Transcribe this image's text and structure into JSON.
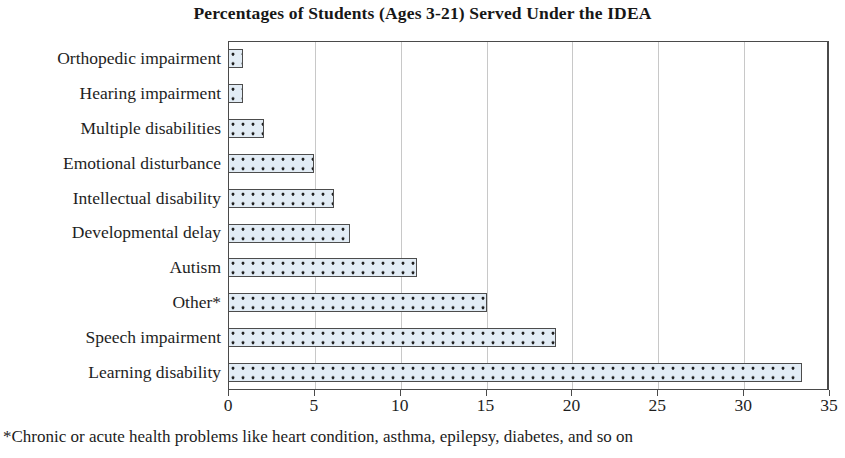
{
  "chart_data": {
    "type": "bar",
    "orientation": "horizontal",
    "title": "Percentages of Students (Ages 3-21) Served Under the IDEA",
    "xlabel": "",
    "ylabel": "",
    "xlim": [
      0,
      35
    ],
    "xticks": [
      0,
      5,
      10,
      15,
      20,
      25,
      30,
      35
    ],
    "xtick_labels": [
      "0",
      "5",
      "10",
      "15",
      "20",
      "25",
      "30",
      "35"
    ],
    "grid": "vertical",
    "legend": "none",
    "categories": [
      "Orthopedic impairment",
      "Hearing impairment",
      "Multiple disabilities",
      "Emotional disturbance",
      "Intellectual disability",
      "Developmental delay",
      "Autism",
      "Other*",
      "Speech impairment",
      "Learning disability"
    ],
    "values": [
      0.9,
      0.9,
      2.1,
      5.0,
      6.2,
      7.1,
      11.0,
      15.1,
      19.1,
      33.4
    ],
    "bar_fill_color": "#e2ecf5",
    "bar_edge_color": "#4c4c4c",
    "bar_pattern": "dotted",
    "footnote": "*Chronic or acute health problems like heart condition, asthma, epilepsy, diabetes, and so on"
  }
}
